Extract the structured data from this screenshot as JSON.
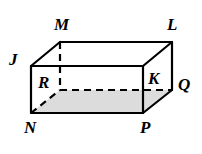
{
  "figure": {
    "name": "rectangular-prism",
    "colors": {
      "stroke": "#000000",
      "background": "#ffffff",
      "shaded_face_fill": "#dcdcdc",
      "hidden_edge": "#000000"
    },
    "stroke_width": 2.2,
    "hidden_stroke_width": 2.2,
    "dash_pattern": "7,5"
  },
  "vertices": [
    {
      "id": "M",
      "label": "M",
      "role": "back-top-left",
      "x": 60,
      "y": 42,
      "hidden": false,
      "label_x": 54,
      "label_y": 16
    },
    {
      "id": "L",
      "label": "L",
      "role": "back-top-right",
      "x": 172,
      "y": 42,
      "hidden": false,
      "label_x": 167,
      "label_y": 16
    },
    {
      "id": "J",
      "label": "J",
      "role": "front-top-left",
      "x": 31,
      "y": 66,
      "hidden": false,
      "label_x": 9,
      "label_y": 51
    },
    {
      "id": "K",
      "label": "K",
      "role": "front-top-right",
      "x": 143,
      "y": 66,
      "hidden": false,
      "label_x": 148,
      "label_y": 70
    },
    {
      "id": "Q",
      "label": "Q",
      "role": "back-bottom-right",
      "x": 172,
      "y": 90,
      "hidden": false,
      "label_x": 178,
      "label_y": 76
    },
    {
      "id": "R",
      "label": "R",
      "role": "back-bottom-left",
      "x": 60,
      "y": 90,
      "hidden": true,
      "label_x": 38,
      "label_y": 74
    },
    {
      "id": "N",
      "label": "N",
      "role": "front-bottom-left",
      "x": 31,
      "y": 113,
      "hidden": false,
      "label_x": 24,
      "label_y": 119
    },
    {
      "id": "P",
      "label": "P",
      "role": "front-bottom-right",
      "x": 143,
      "y": 113,
      "hidden": false,
      "label_x": 140,
      "label_y": 119
    }
  ],
  "edges": [
    {
      "id": "JK",
      "from": "J",
      "to": "K",
      "hidden": false,
      "name": "front-top-edge"
    },
    {
      "id": "KP",
      "from": "K",
      "to": "P",
      "hidden": false,
      "name": "front-right-edge"
    },
    {
      "id": "PN",
      "from": "P",
      "to": "N",
      "hidden": false,
      "name": "front-bottom-edge"
    },
    {
      "id": "NJ",
      "from": "N",
      "to": "J",
      "hidden": false,
      "name": "front-left-edge"
    },
    {
      "id": "ML",
      "from": "M",
      "to": "L",
      "hidden": false,
      "name": "back-top-edge"
    },
    {
      "id": "LQ",
      "from": "L",
      "to": "Q",
      "hidden": false,
      "name": "back-right-edge"
    },
    {
      "id": "JM",
      "from": "J",
      "to": "M",
      "hidden": false,
      "name": "top-left-depth-edge"
    },
    {
      "id": "KL",
      "from": "K",
      "to": "L",
      "hidden": false,
      "name": "top-right-depth-edge"
    },
    {
      "id": "PQ",
      "from": "P",
      "to": "Q",
      "hidden": false,
      "name": "bottom-right-depth-edge"
    },
    {
      "id": "MR",
      "from": "M",
      "to": "R",
      "hidden": true,
      "name": "back-left-edge-hidden"
    },
    {
      "id": "RQ",
      "from": "R",
      "to": "Q",
      "hidden": true,
      "name": "back-bottom-edge-hidden"
    },
    {
      "id": "NR",
      "from": "N",
      "to": "R",
      "hidden": true,
      "name": "bottom-left-depth-edge-hidden"
    }
  ],
  "shaded_face": {
    "name": "bottom-face",
    "points": "31,113 60,90 172,90 143,113"
  },
  "chart_data": {
    "type": "diagram",
    "title": "",
    "shape": "rectangular prism",
    "labeled_vertices": [
      "M",
      "L",
      "J",
      "K",
      "Q",
      "R",
      "N",
      "P"
    ],
    "hidden_vertices": [
      "R"
    ],
    "visible_faces": [
      "front JKPN",
      "top JKLM",
      "right KLQP"
    ],
    "shaded_faces": [
      "bottom NRQP"
    ]
  }
}
